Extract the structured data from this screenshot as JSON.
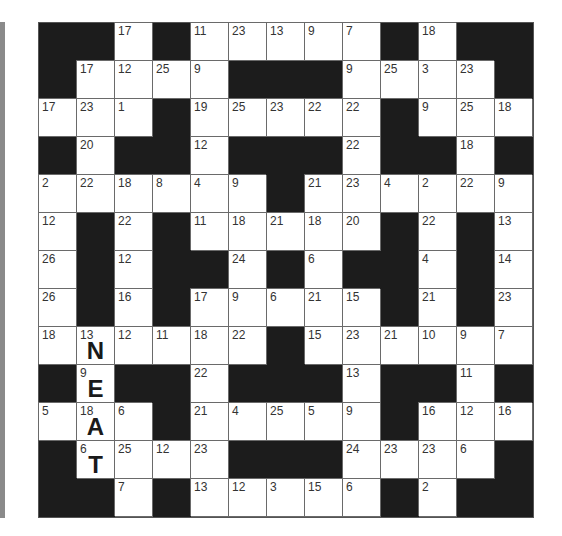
{
  "puzzle": {
    "type": "codeword",
    "rows": 13,
    "cols": 13,
    "black_color": "#1c1c1c",
    "white_color": "#ffffff",
    "grid": [
      [
        "#",
        "#",
        "17",
        "#",
        "11",
        "23",
        "13",
        "9",
        "7",
        "#",
        "18",
        "#",
        "#"
      ],
      [
        "#",
        "17",
        "12",
        "25",
        "9",
        "#",
        "#",
        "#",
        "9",
        "25",
        "3",
        "23",
        "#"
      ],
      [
        "17",
        "23",
        "1",
        "#",
        "19",
        "25",
        "23",
        "22",
        "22",
        "#",
        "9",
        "25",
        "18"
      ],
      [
        "#",
        "20",
        "#",
        "#",
        "12",
        "#",
        "#",
        "#",
        "22",
        "#",
        "#",
        "18",
        "#"
      ],
      [
        "2",
        "22",
        "18",
        "8",
        "4",
        "9",
        "#",
        "21",
        "23",
        "4",
        "2",
        "22",
        "9"
      ],
      [
        "12",
        "#",
        "22",
        "#",
        "11",
        "18",
        "21",
        "18",
        "20",
        "#",
        "22",
        "#",
        "13"
      ],
      [
        "26",
        "#",
        "12",
        "#",
        "#",
        "24",
        "#",
        "6",
        "#",
        "#",
        "4",
        "#",
        "14"
      ],
      [
        "26",
        "#",
        "16",
        "#",
        "17",
        "9",
        "6",
        "21",
        "15",
        "#",
        "21",
        "#",
        "23"
      ],
      [
        "18",
        "13",
        "12",
        "11",
        "18",
        "22",
        "#",
        "15",
        "23",
        "21",
        "10",
        "9",
        "7"
      ],
      [
        "#",
        "9",
        "#",
        "#",
        "22",
        "#",
        "#",
        "#",
        "13",
        "#",
        "#",
        "11",
        "#"
      ],
      [
        "5",
        "18",
        "6",
        "#",
        "21",
        "4",
        "25",
        "5",
        "9",
        "#",
        "16",
        "12",
        "16"
      ],
      [
        "#",
        "6",
        "25",
        "12",
        "23",
        "#",
        "#",
        "#",
        "24",
        "23",
        "23",
        "6",
        "#"
      ],
      [
        "#",
        "#",
        "7",
        "#",
        "13",
        "12",
        "3",
        "15",
        "6",
        "#",
        "2",
        "#",
        "#"
      ]
    ],
    "filled_letters": [
      {
        "row": 8,
        "col": 1,
        "number": "13",
        "letter": "N"
      },
      {
        "row": 9,
        "col": 1,
        "number": "9",
        "letter": "E"
      },
      {
        "row": 10,
        "col": 1,
        "number": "18",
        "letter": "A"
      },
      {
        "row": 11,
        "col": 1,
        "number": "6",
        "letter": "T"
      }
    ],
    "revealed_word": "NEAT"
  }
}
